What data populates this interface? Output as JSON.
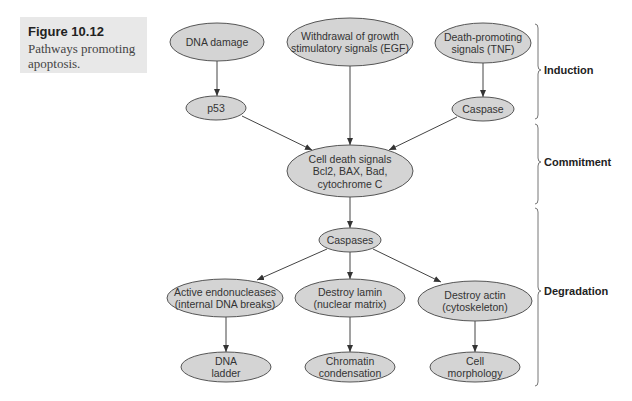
{
  "caption": {
    "title": "Figure 10.12",
    "text": "Pathways promoting apoptosis."
  },
  "colors": {
    "node_fill": "#d4d4d4",
    "node_stroke": "#555555",
    "caption_bg": "#e8e8e8"
  },
  "nodes": [
    {
      "id": "dna-damage",
      "lines": [
        "DNA damage"
      ],
      "cx": 217,
      "cy": 42,
      "rx": 47,
      "ry": 19
    },
    {
      "id": "withdrawal-growth",
      "lines": [
        "Withdrawal of growth",
        "stimulatory signals (EGF)"
      ],
      "cx": 350,
      "cy": 42,
      "rx": 63,
      "ry": 24
    },
    {
      "id": "death-promoting",
      "lines": [
        "Death-promoting",
        "signals (TNF)"
      ],
      "cx": 483,
      "cy": 43,
      "rx": 48,
      "ry": 20
    },
    {
      "id": "p53",
      "lines": [
        "p53"
      ],
      "cx": 216,
      "cy": 108,
      "rx": 30,
      "ry": 12
    },
    {
      "id": "caspase",
      "lines": [
        "Caspase"
      ],
      "cx": 483,
      "cy": 109,
      "rx": 31,
      "ry": 12
    },
    {
      "id": "cell-death-signals",
      "lines": [
        "Cell death signals",
        "Bcl2, BAX, Bad,",
        "cytochrome C"
      ],
      "cx": 350,
      "cy": 171,
      "rx": 63,
      "ry": 26
    },
    {
      "id": "caspases",
      "lines": [
        "Caspases"
      ],
      "cx": 350,
      "cy": 240,
      "rx": 31,
      "ry": 12
    },
    {
      "id": "active-endonucleases",
      "lines": [
        "Active endonucleases",
        "(internal DNA breaks)"
      ],
      "cx": 225,
      "cy": 298,
      "rx": 58,
      "ry": 19
    },
    {
      "id": "destroy-lamin",
      "lines": [
        "Destroy lamin",
        "(nuclear matrix)"
      ],
      "cx": 350,
      "cy": 298,
      "rx": 55,
      "ry": 19
    },
    {
      "id": "destroy-actin",
      "lines": [
        "Destroy actin",
        "(cytoskeleton)"
      ],
      "cx": 475,
      "cy": 301,
      "rx": 57,
      "ry": 20
    },
    {
      "id": "dna-ladder",
      "lines": [
        "DNA",
        "ladder"
      ],
      "cx": 226,
      "cy": 367,
      "rx": 45,
      "ry": 15
    },
    {
      "id": "chromatin-condensation",
      "lines": [
        "Chromatin",
        "condensation"
      ],
      "cx": 350,
      "cy": 367,
      "rx": 45,
      "ry": 15
    },
    {
      "id": "cell-morphology",
      "lines": [
        "Cell",
        "morphology"
      ],
      "cx": 475,
      "cy": 367,
      "rx": 45,
      "ry": 15
    }
  ],
  "edges": [
    {
      "from": "dna-damage",
      "to": "p53",
      "x1": 217,
      "y1": 61,
      "x2": 217,
      "y2": 96
    },
    {
      "from": "death-promoting",
      "to": "caspase",
      "x1": 483,
      "y1": 63,
      "x2": 483,
      "y2": 97
    },
    {
      "from": "withdrawal-growth",
      "to": "cell-death-signals",
      "x1": 350,
      "y1": 66,
      "x2": 350,
      "y2": 145
    },
    {
      "from": "p53",
      "to": "cell-death-signals",
      "x1": 242,
      "y1": 116,
      "x2": 312,
      "y2": 150
    },
    {
      "from": "caspase",
      "to": "cell-death-signals",
      "x1": 457,
      "y1": 117,
      "x2": 389,
      "y2": 150
    },
    {
      "from": "cell-death-signals",
      "to": "caspases",
      "x1": 350,
      "y1": 197,
      "x2": 350,
      "y2": 228
    },
    {
      "from": "caspases",
      "to": "active-endonucleases",
      "x1": 327,
      "y1": 249,
      "x2": 257,
      "y2": 280
    },
    {
      "from": "caspases",
      "to": "destroy-lamin",
      "x1": 350,
      "y1": 252,
      "x2": 350,
      "y2": 279
    },
    {
      "from": "caspases",
      "to": "destroy-actin",
      "x1": 373,
      "y1": 249,
      "x2": 441,
      "y2": 282
    },
    {
      "from": "active-endonucleases",
      "to": "dna-ladder",
      "x1": 226,
      "y1": 317,
      "x2": 226,
      "y2": 352
    },
    {
      "from": "destroy-lamin",
      "to": "chromatin-condensation",
      "x1": 350,
      "y1": 317,
      "x2": 350,
      "y2": 352
    },
    {
      "from": "destroy-actin",
      "to": "cell-morphology",
      "x1": 475,
      "y1": 321,
      "x2": 475,
      "y2": 352
    }
  ],
  "stages": [
    {
      "id": "induction",
      "label": "Induction",
      "y_top": 24,
      "y_bottom": 119,
      "y_tip": 70
    },
    {
      "id": "commitment",
      "label": "Commitment",
      "y_top": 124,
      "y_bottom": 204,
      "y_tip": 162
    },
    {
      "id": "degradation",
      "label": "Degradation",
      "y_top": 208,
      "y_bottom": 386,
      "y_tip": 291
    }
  ]
}
